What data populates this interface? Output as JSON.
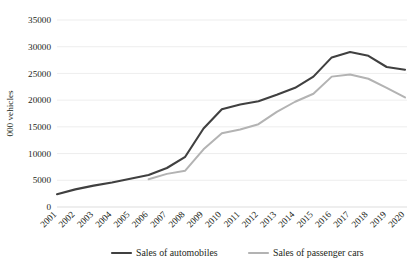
{
  "chart_data": {
    "type": "line",
    "title": "",
    "xlabel": "",
    "ylabel": "000 vehicles",
    "ylim": [
      0,
      35000
    ],
    "ytick_step": 5000,
    "yticks": [
      "0",
      "5000",
      "10000",
      "15000",
      "20000",
      "25000",
      "30000",
      "35000"
    ],
    "grid": true,
    "legend_position": "bottom",
    "categories": [
      "2001",
      "2002",
      "2003",
      "2004",
      "2005",
      "2006",
      "2007",
      "2008",
      "2009",
      "2010",
      "2011",
      "2012",
      "2013",
      "2014",
      "2015",
      "2016",
      "2017",
      "2018",
      "2019",
      "2020"
    ],
    "series": [
      {
        "name": "Sales of automobiles",
        "color": "#404040",
        "values": [
          2400,
          3300,
          4000,
          4600,
          5300,
          6000,
          7300,
          9400,
          14700,
          18300,
          19200,
          19800,
          21000,
          22300,
          24400,
          28000,
          29000,
          28300,
          26200,
          25700
        ]
      },
      {
        "name": "Sales of passenger cars",
        "color": "#b3b3b3",
        "values": [
          null,
          null,
          null,
          null,
          null,
          5200,
          6200,
          6800,
          10800,
          13800,
          14500,
          15500,
          17800,
          19700,
          21200,
          24400,
          24800,
          24000,
          22300,
          20500
        ]
      }
    ]
  },
  "legend": {
    "items": [
      {
        "label": "Sales of automobiles",
        "color": "#404040"
      },
      {
        "label": "Sales of passenger cars",
        "color": "#b3b3b3"
      }
    ]
  },
  "axes": {
    "y_axis_title": "000 vehicles"
  }
}
